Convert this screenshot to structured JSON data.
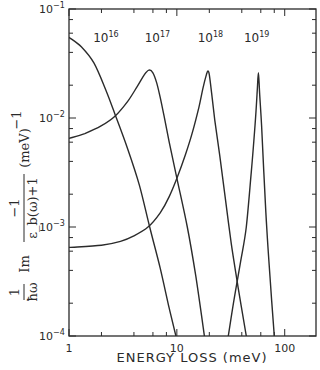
{
  "chart_data": {
    "type": "line",
    "title": "",
    "xlabel": "ENERGY LOSS (meV)",
    "ylabel": "1/ħω Im [ −1 / (ε_b(ω)+1) ] (meV)^−1",
    "xscale": "log",
    "yscale": "log",
    "xlim": [
      1,
      195
    ],
    "ylim": [
      0.0001,
      0.1
    ],
    "grid": false,
    "legend": "inline curve labels",
    "x_ticks": [
      {
        "value": 1,
        "label": "1"
      },
      {
        "value": 10,
        "label": "10"
      },
      {
        "value": 100,
        "label": "100"
      }
    ],
    "x_minor_ticks": [
      2,
      4,
      6,
      8,
      20,
      40,
      60,
      80
    ],
    "y_ticks": [
      {
        "value": 0.1,
        "base": "10",
        "exp": "-1"
      },
      {
        "value": 0.01,
        "base": "10",
        "exp": "-2"
      },
      {
        "value": 0.001,
        "base": "10",
        "exp": "-3"
      },
      {
        "value": 0.0001,
        "base": "10",
        "exp": "-4"
      }
    ],
    "y_minor_ticks": [
      0.02,
      0.04,
      0.06,
      0.08,
      0.002,
      0.004,
      0.006,
      0.008,
      0.0002,
      0.0004,
      0.0006,
      0.0008
    ],
    "series": [
      {
        "name": "10^16",
        "label_base": "10",
        "label_exp": "16",
        "label_pos": [
          2.2,
          0.05
        ],
        "points": [
          [
            1,
            0.055
          ],
          [
            1.3,
            0.045
          ],
          [
            1.7,
            0.032
          ],
          [
            2.2,
            0.018
          ],
          [
            2.7,
            0.0105
          ],
          [
            3.5,
            0.0052
          ],
          [
            4.5,
            0.0024
          ],
          [
            5.6,
            0.001
          ],
          [
            7,
            0.00042
          ],
          [
            8.5,
            0.00018
          ],
          [
            9.8,
            0.0001
          ]
        ]
      },
      {
        "name": "10^17",
        "label_base": "10",
        "label_exp": "17",
        "label_pos": [
          6.6,
          0.05
        ],
        "points": [
          [
            1,
            0.0065
          ],
          [
            1.4,
            0.0072
          ],
          [
            2,
            0.0085
          ],
          [
            2.7,
            0.0105
          ],
          [
            3.5,
            0.0142
          ],
          [
            4.3,
            0.0195
          ],
          [
            5,
            0.025
          ],
          [
            5.5,
            0.0275
          ],
          [
            6,
            0.026
          ],
          [
            6.5,
            0.021
          ],
          [
            7,
            0.0155
          ],
          [
            7.6,
            0.0105
          ],
          [
            8.5,
            0.006
          ],
          [
            10,
            0.0028
          ],
          [
            12.5,
            0.001
          ],
          [
            15,
            0.00035
          ],
          [
            18,
            0.0001
          ]
        ]
      },
      {
        "name": "10^18",
        "label_base": "10",
        "label_exp": "18",
        "label_pos": [
          20.5,
          0.05
        ],
        "points": [
          [
            1,
            0.00065
          ],
          [
            2,
            0.00068
          ],
          [
            3,
            0.00074
          ],
          [
            4,
            0.00083
          ],
          [
            5.4,
            0.001
          ],
          [
            7,
            0.00135
          ],
          [
            8.5,
            0.0019
          ],
          [
            10,
            0.0028
          ],
          [
            12,
            0.0046
          ],
          [
            14,
            0.0075
          ],
          [
            16,
            0.0125
          ],
          [
            17.5,
            0.019
          ],
          [
            18.8,
            0.025
          ],
          [
            19.4,
            0.027
          ],
          [
            20,
            0.025
          ],
          [
            21,
            0.017
          ],
          [
            22.5,
            0.0095
          ],
          [
            25,
            0.0045
          ],
          [
            28,
            0.0019
          ],
          [
            32,
            0.0007
          ],
          [
            37,
            0.00028
          ],
          [
            44,
            0.0001
          ]
        ]
      },
      {
        "name": "10^19",
        "label_base": "10",
        "label_exp": "19",
        "label_pos": [
          55,
          0.05
        ],
        "points": [
          [
            30,
            0.0001
          ],
          [
            34,
            0.00022
          ],
          [
            39,
            0.00048
          ],
          [
            44,
            0.001
          ],
          [
            49,
            0.0032
          ],
          [
            53,
            0.0085
          ],
          [
            55.5,
            0.017
          ],
          [
            57,
            0.026
          ],
          [
            58.5,
            0.017
          ],
          [
            61,
            0.0085
          ],
          [
            64,
            0.0032
          ],
          [
            68,
            0.001
          ],
          [
            73,
            0.00035
          ],
          [
            80,
            0.0001
          ]
        ]
      }
    ]
  },
  "axes": {
    "xlabel": "ENERGY LOSS (meV)",
    "ylabel_parts": {
      "prefix_num": "1",
      "prefix_den": "ħω",
      "im": "Im",
      "frac_num": "−1",
      "frac_den": "ε_b(ω)+1",
      "unit": "(meV)",
      "unit_exp": "−1"
    }
  }
}
